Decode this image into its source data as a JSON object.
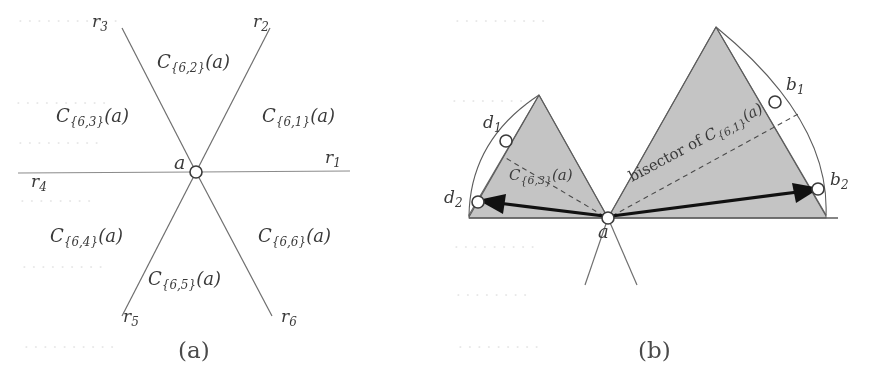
{
  "figure": {
    "kind": "two-panel geometric diagram",
    "background_color": "#ffffff",
    "cone_fill_color": "#c4c4c4",
    "line_color": "#6f6f6f",
    "arrow_color": "#111111"
  },
  "panel_a": {
    "caption": "(a)",
    "center_label": "a",
    "rays": [
      {
        "name": "r1",
        "label": "r₁",
        "sub": "1"
      },
      {
        "name": "r2",
        "label": "r₂",
        "sub": "2"
      },
      {
        "name": "r3",
        "label": "r₃",
        "sub": "3"
      },
      {
        "name": "r4",
        "label": "r₄",
        "sub": "4"
      },
      {
        "name": "r5",
        "label": "r₅",
        "sub": "5"
      },
      {
        "name": "r6",
        "label": "r₆",
        "sub": "6"
      }
    ],
    "cones": [
      {
        "name": "cone-6-1",
        "base": "C",
        "sub": "{6,1}",
        "arg": "(a)"
      },
      {
        "name": "cone-6-2",
        "base": "C",
        "sub": "{6,2}",
        "arg": "(a)"
      },
      {
        "name": "cone-6-3",
        "base": "C",
        "sub": "{6,3}",
        "arg": "(a)"
      },
      {
        "name": "cone-6-4",
        "base": "C",
        "sub": "{6,4}",
        "arg": "(a)"
      },
      {
        "name": "cone-6-5",
        "base": "C",
        "sub": "{6,5}",
        "arg": "(a)"
      },
      {
        "name": "cone-6-6",
        "base": "C",
        "sub": "{6,6}",
        "arg": "(a)"
      }
    ]
  },
  "panel_b": {
    "caption": "(b)",
    "center_label": "a",
    "points": [
      {
        "name": "point-d1",
        "label": "d",
        "sub": "1"
      },
      {
        "name": "point-d2",
        "label": "d",
        "sub": "2"
      },
      {
        "name": "point-b1",
        "label": "b",
        "sub": "1"
      },
      {
        "name": "point-b2",
        "label": "b",
        "sub": "2"
      }
    ],
    "left_cone_label": {
      "base": "C",
      "sub": "{6,3}",
      "arg": "(a)"
    },
    "bisector_label": {
      "prefix": "bisector of ",
      "base": "C",
      "sub": "{6,1}",
      "arg": "(a)"
    }
  },
  "bleed_text": {
    "note": "faint show-through text from the reverse page",
    "lines": [
      "of the region",
      "points with",
      "relation"
    ]
  }
}
